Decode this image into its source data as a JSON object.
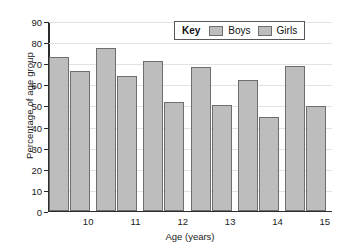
{
  "chart_data": {
    "type": "bar",
    "title": "",
    "xlabel": "Age (years)",
    "ylabel": "Percentage of age group",
    "categories": [
      "10",
      "11",
      "12",
      "13",
      "14",
      "15"
    ],
    "series": [
      {
        "name": "Boys",
        "values": [
          72.5,
          77,
          71,
          68,
          62,
          68.5
        ]
      },
      {
        "name": "Girls",
        "values": [
          66,
          63.5,
          51.5,
          50,
          44.5,
          49.5
        ]
      }
    ],
    "ylim": [
      0,
      90
    ],
    "ytick_labels": [
      "0",
      "10",
      "20",
      "30",
      "40",
      "50",
      "60",
      "70",
      "80",
      "90"
    ],
    "ytick_values": [
      0,
      10,
      20,
      30,
      40,
      50,
      60,
      70,
      80,
      90
    ],
    "grid": true,
    "legend": {
      "position": "top-right",
      "title": "Key",
      "entries": [
        "Boys",
        "Girls"
      ]
    },
    "colors": {
      "bar_fill": "#bdbdbd",
      "bar_border": "#6e6e6e",
      "axis": "#2b2b2b",
      "grid": "#e3e3e3",
      "text": "#1a1a1a"
    }
  }
}
